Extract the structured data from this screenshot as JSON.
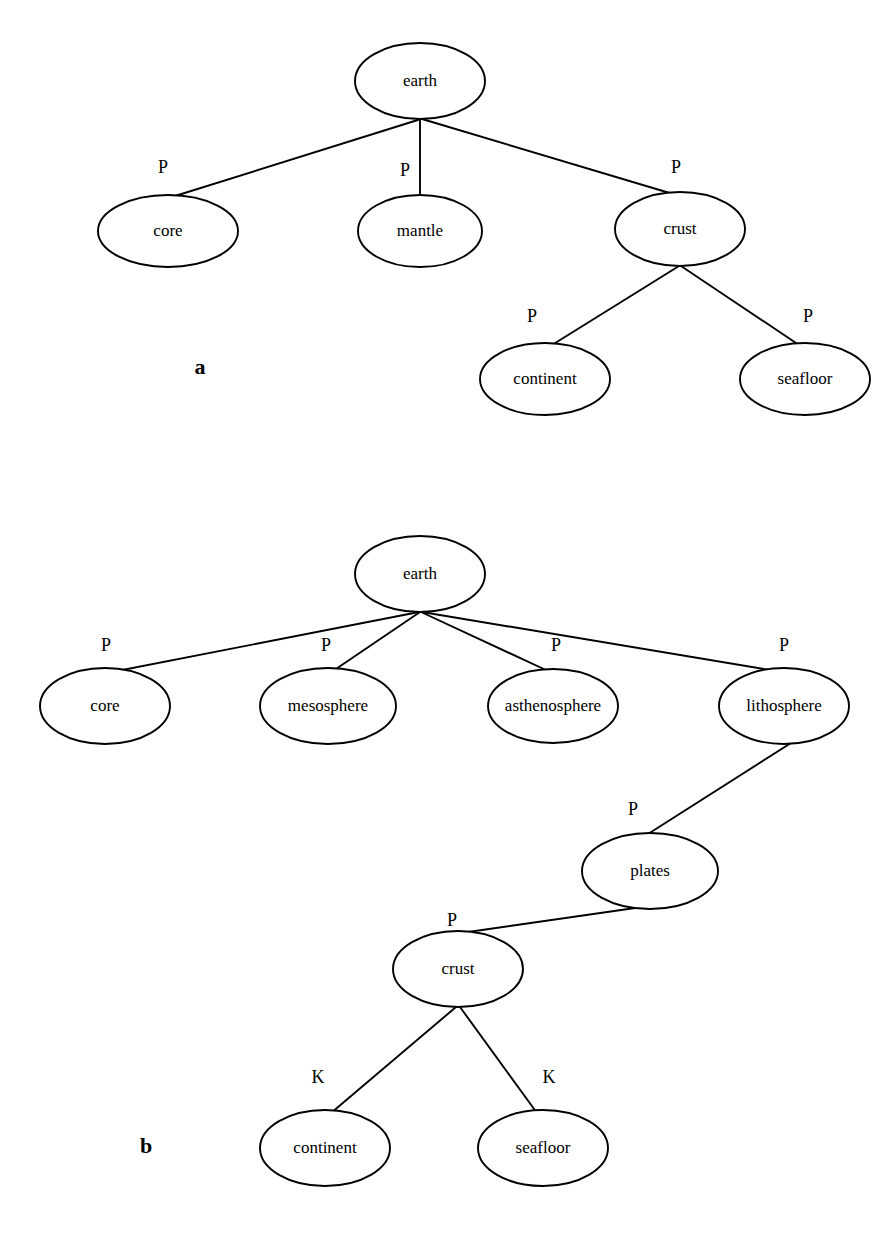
{
  "figure": {
    "background_color": "#ffffff",
    "stroke_color": "#000000",
    "panels": [
      {
        "id": "a",
        "label": "a",
        "label_x": 200,
        "label_y": 369,
        "nodes": [
          {
            "id": "a-earth",
            "label": "earth",
            "cx": 420,
            "cy": 81,
            "rx": 65,
            "ry": 38
          },
          {
            "id": "a-core",
            "label": "core",
            "cx": 168,
            "cy": 231,
            "rx": 70,
            "ry": 36
          },
          {
            "id": "a-mantle",
            "label": "mantle",
            "cx": 420,
            "cy": 231,
            "rx": 62,
            "ry": 36
          },
          {
            "id": "a-crust",
            "label": "crust",
            "cx": 680,
            "cy": 229,
            "rx": 65,
            "ry": 37
          },
          {
            "id": "a-continent",
            "label": "continent",
            "cx": 545,
            "cy": 379,
            "rx": 65,
            "ry": 36
          },
          {
            "id": "a-seafloor",
            "label": "seafloor",
            "cx": 805,
            "cy": 379,
            "rx": 65,
            "ry": 36
          }
        ],
        "edges": [
          {
            "id": "a-edge-earth-core",
            "from": "a-earth",
            "to": "a-core",
            "label": "P",
            "x1": 421,
            "y1": 119,
            "x2": 175,
            "y2": 196,
            "lx": 163,
            "ly": 169
          },
          {
            "id": "a-edge-earth-mantle",
            "from": "a-earth",
            "to": "a-mantle",
            "label": "P",
            "x1": 420,
            "y1": 119,
            "x2": 420,
            "y2": 196,
            "lx": 405,
            "ly": 172
          },
          {
            "id": "a-edge-earth-crust",
            "from": "a-earth",
            "to": "a-crust",
            "label": "P",
            "x1": 422,
            "y1": 119,
            "x2": 673,
            "y2": 194,
            "lx": 676,
            "ly": 169
          },
          {
            "id": "a-edge-crust-continent",
            "from": "a-crust",
            "to": "a-continent",
            "label": "P",
            "x1": 679,
            "y1": 266,
            "x2": 552,
            "y2": 345,
            "lx": 532,
            "ly": 318
          },
          {
            "id": "a-edge-crust-seafloor",
            "from": "a-crust",
            "to": "a-seafloor",
            "label": "P",
            "x1": 681,
            "y1": 266,
            "x2": 799,
            "y2": 345,
            "lx": 808,
            "ly": 318
          }
        ]
      },
      {
        "id": "b",
        "label": "b",
        "label_x": 146,
        "label_y": 1148,
        "nodes": [
          {
            "id": "b-earth",
            "label": "earth",
            "cx": 420,
            "cy": 574,
            "rx": 65,
            "ry": 38
          },
          {
            "id": "b-core",
            "label": "core",
            "cx": 105,
            "cy": 706,
            "rx": 65,
            "ry": 38
          },
          {
            "id": "b-mesosphere",
            "label": "mesosphere",
            "cx": 328,
            "cy": 706,
            "rx": 68,
            "ry": 38
          },
          {
            "id": "b-asthenosphere",
            "label": "asthenosphere",
            "cx": 553,
            "cy": 706,
            "rx": 65,
            "ry": 37
          },
          {
            "id": "b-lithosphere",
            "label": "lithosphere",
            "cx": 784,
            "cy": 706,
            "rx": 65,
            "ry": 38
          },
          {
            "id": "b-plates",
            "label": "plates",
            "cx": 650,
            "cy": 871,
            "rx": 68,
            "ry": 38
          },
          {
            "id": "b-crust",
            "label": "crust",
            "cx": 458,
            "cy": 969,
            "rx": 65,
            "ry": 38
          },
          {
            "id": "b-continent",
            "label": "continent",
            "cx": 325,
            "cy": 1148,
            "rx": 65,
            "ry": 38
          },
          {
            "id": "b-seafloor",
            "label": "seafloor",
            "cx": 543,
            "cy": 1148,
            "rx": 65,
            "ry": 38
          }
        ],
        "edges": [
          {
            "id": "b-edge-earth-core",
            "from": "b-earth",
            "to": "b-core",
            "label": "P",
            "x1": 419,
            "y1": 612,
            "x2": 112,
            "y2": 672,
            "lx": 106,
            "ly": 647
          },
          {
            "id": "b-edge-earth-mesosphere",
            "from": "b-earth",
            "to": "b-mesosphere",
            "label": "P",
            "x1": 420,
            "y1": 612,
            "x2": 333,
            "y2": 671,
            "lx": 326,
            "ly": 647
          },
          {
            "id": "b-edge-earth-asthenosphere",
            "from": "b-earth",
            "to": "b-asthenosphere",
            "label": "P",
            "x1": 421,
            "y1": 612,
            "x2": 548,
            "y2": 671,
            "lx": 556,
            "ly": 647
          },
          {
            "id": "b-edge-earth-lithosphere",
            "from": "b-earth",
            "to": "b-lithosphere",
            "label": "P",
            "x1": 422,
            "y1": 612,
            "x2": 776,
            "y2": 671,
            "lx": 784,
            "ly": 647
          },
          {
            "id": "b-edge-lithosphere-plates",
            "from": "b-lithosphere",
            "to": "b-plates",
            "label": "P",
            "x1": 791,
            "y1": 743,
            "x2": 648,
            "y2": 834,
            "lx": 633,
            "ly": 811
          },
          {
            "id": "b-edge-plates-crust",
            "from": "b-plates",
            "to": "b-crust",
            "label": "P",
            "x1": 649,
            "y1": 906,
            "x2": 461,
            "y2": 933,
            "lx": 452,
            "ly": 922
          },
          {
            "id": "b-edge-crust-continent",
            "from": "b-crust",
            "to": "b-continent",
            "label": "K",
            "x1": 456,
            "y1": 1007,
            "x2": 331,
            "y2": 1113,
            "lx": 318,
            "ly": 1079
          },
          {
            "id": "b-edge-crust-seafloor",
            "from": "b-crust",
            "to": "b-seafloor",
            "label": "K",
            "x1": 460,
            "y1": 1007,
            "x2": 537,
            "y2": 1113,
            "lx": 549,
            "ly": 1079
          }
        ]
      }
    ]
  }
}
